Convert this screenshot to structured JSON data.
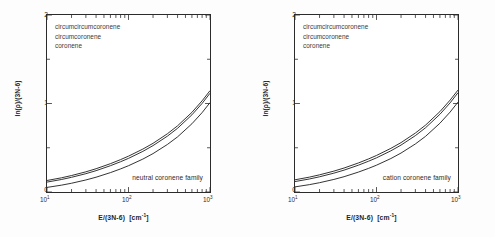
{
  "figure": {
    "background_color": "#fdfdfd",
    "frame_color": "#2b2b2b",
    "curve_color": "#1a1a1a"
  },
  "panels": [
    {
      "id": "neutral",
      "annotation": "neutral coronene family",
      "legend": [
        "circumcircumcoronene",
        "circumcoronene",
        "coronene"
      ],
      "xaxis": {
        "title_main": "E/(3N-6)",
        "title_units": "[cm",
        "title_units_sup": "-1",
        "title_units_close": "]",
        "ticks": [
          {
            "label_base": "10",
            "label_exp": "1",
            "value": 10
          },
          {
            "label_base": "10",
            "label_exp": "2",
            "value": 100
          },
          {
            "label_base": "10",
            "label_exp": "3",
            "value": 1000
          }
        ],
        "scale": "log",
        "min": 10,
        "max": 1000
      },
      "yaxis": {
        "title": "ln(ρ)/(3N-6)",
        "ticks": [
          "0",
          "1",
          "2"
        ],
        "scale": "linear",
        "min": 0,
        "max": 2
      }
    },
    {
      "id": "cation",
      "annotation": "cation coronene family",
      "legend": [
        "circumcircumcoronene",
        "circumcoronene",
        "coronene"
      ],
      "xaxis": {
        "title_main": "E/(3N-6)",
        "title_units": "[cm",
        "title_units_sup": "-1",
        "title_units_close": "]",
        "ticks": [
          {
            "label_base": "10",
            "label_exp": "1",
            "value": 10
          },
          {
            "label_base": "10",
            "label_exp": "2",
            "value": 100
          },
          {
            "label_base": "10",
            "label_exp": "3",
            "value": 1000
          }
        ],
        "scale": "log",
        "min": 10,
        "max": 1000
      },
      "yaxis": {
        "title": "ln(ρ)/(3N-6)",
        "ticks": [
          "0",
          "1",
          "2"
        ],
        "scale": "linear",
        "min": 0,
        "max": 2
      }
    }
  ],
  "chart_data": [
    {
      "type": "line",
      "title": "neutral coronene family",
      "xlabel": "E/(3N-6)  [cm-1]",
      "ylabel": "ln(rho)/(3N-6)",
      "xscale": "log",
      "yscale": "linear",
      "xlim": [
        10,
        1000
      ],
      "ylim": [
        0,
        2
      ],
      "grid": false,
      "legend_position": "top-left",
      "x": [
        10,
        15,
        20,
        30,
        40,
        60,
        80,
        100,
        150,
        200,
        300,
        400,
        600,
        800,
        1000
      ],
      "series": [
        {
          "name": "circumcircumcoronene",
          "values": [
            0.13,
            0.16,
            0.186,
            0.228,
            0.263,
            0.32,
            0.366,
            0.405,
            0.485,
            0.55,
            0.658,
            0.748,
            0.9,
            1.03,
            1.145
          ]
        },
        {
          "name": "circumcoronene",
          "values": [
            0.112,
            0.141,
            0.166,
            0.207,
            0.241,
            0.297,
            0.342,
            0.38,
            0.459,
            0.524,
            0.631,
            0.72,
            0.872,
            1.001,
            1.116
          ]
        },
        {
          "name": "coronene",
          "values": [
            0.052,
            0.077,
            0.099,
            0.136,
            0.167,
            0.219,
            0.261,
            0.297,
            0.372,
            0.434,
            0.537,
            0.623,
            0.771,
            0.897,
            1.01
          ]
        }
      ]
    },
    {
      "type": "line",
      "title": "cation coronene family",
      "xlabel": "E/(3N-6)  [cm-1]",
      "ylabel": "ln(rho)/(3N-6)",
      "xscale": "log",
      "yscale": "linear",
      "xlim": [
        10,
        1000
      ],
      "ylim": [
        0,
        2
      ],
      "grid": false,
      "legend_position": "top-left",
      "x": [
        10,
        15,
        20,
        30,
        40,
        60,
        80,
        100,
        150,
        200,
        300,
        400,
        600,
        800,
        1000
      ],
      "series": [
        {
          "name": "circumcircumcoronene",
          "values": [
            0.138,
            0.168,
            0.194,
            0.236,
            0.271,
            0.328,
            0.374,
            0.413,
            0.493,
            0.558,
            0.666,
            0.756,
            0.908,
            1.038,
            1.152
          ]
        },
        {
          "name": "circumcoronene",
          "values": [
            0.118,
            0.147,
            0.172,
            0.213,
            0.247,
            0.303,
            0.348,
            0.386,
            0.465,
            0.53,
            0.637,
            0.726,
            0.878,
            1.007,
            1.122
          ]
        },
        {
          "name": "coronene",
          "values": [
            0.058,
            0.083,
            0.105,
            0.142,
            0.173,
            0.225,
            0.267,
            0.303,
            0.378,
            0.44,
            0.543,
            0.629,
            0.777,
            0.903,
            1.016
          ]
        }
      ]
    }
  ]
}
